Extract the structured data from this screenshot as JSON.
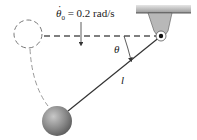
{
  "diagram": {
    "type": "pendulum-mechanics-figure",
    "labels": {
      "initial_rate_symbol": "θ",
      "initial_rate_dot": "·",
      "initial_rate_subscript": "0",
      "initial_rate_value": " = 0.2 rad/s",
      "angle": "θ",
      "length": "l"
    },
    "elements": [
      "fixed-support",
      "pivot-pin",
      "horizontal-dashed-reference",
      "initial-position-dashed-circle",
      "dashed-trajectory",
      "rod",
      "ball",
      "angle-arc",
      "velocity-direction-arrow"
    ],
    "colors": {
      "line": "#222222",
      "dashed": "#555555",
      "support_fill": "#b8b8b8",
      "ball_fill": "#8a8a8a",
      "background": "#ffffff"
    }
  }
}
